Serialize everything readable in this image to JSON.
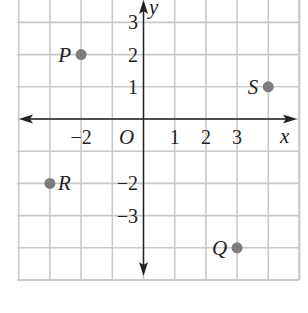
{
  "chart_data": {
    "type": "scatter",
    "title": "",
    "xlabel": "x",
    "ylabel": "y",
    "origin_label": "O",
    "xlim": [
      -4,
      5
    ],
    "ylim": [
      -5,
      3.8
    ],
    "grid": true,
    "x_tick_labels": [
      {
        "value": -2,
        "label": "−2"
      },
      {
        "value": 1,
        "label": "1"
      },
      {
        "value": 2,
        "label": "2"
      },
      {
        "value": 3,
        "label": "3"
      }
    ],
    "y_tick_labels": [
      {
        "value": 3,
        "label": "3"
      },
      {
        "value": 2,
        "label": "2"
      },
      {
        "value": 1,
        "label": "1"
      },
      {
        "value": -2,
        "label": "−2"
      },
      {
        "value": -3,
        "label": "−3"
      }
    ],
    "points": [
      {
        "name": "P",
        "x": -2,
        "y": 2,
        "label_side": "left"
      },
      {
        "name": "S",
        "x": 4,
        "y": 1,
        "label_side": "left"
      },
      {
        "name": "R",
        "x": -3,
        "y": -2,
        "label_side": "right"
      },
      {
        "name": "Q",
        "x": 3,
        "y": -4,
        "label_side": "left"
      }
    ],
    "colors": {
      "point": "#7d7d7d",
      "grid": "#c9c9c9",
      "axis": "#222222"
    }
  }
}
